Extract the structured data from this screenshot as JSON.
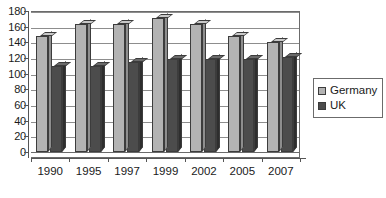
{
  "chart_data": {
    "type": "bar",
    "title": "",
    "subtitle": "",
    "xlabel": "",
    "ylabel": "",
    "categories": [
      "1990",
      "1995",
      "1997",
      "1999",
      "2002",
      "2005",
      "2007"
    ],
    "series": [
      {
        "name": "Germany",
        "color": "#b3b3b3",
        "values": [
          148,
          163,
          163,
          171,
          163,
          148,
          141
        ]
      },
      {
        "name": "UK",
        "color": "#4c4c4c",
        "values": [
          110,
          110,
          115,
          119,
          119,
          119,
          121
        ]
      }
    ],
    "ylim": [
      0,
      180
    ],
    "y_ticks": [
      0,
      20,
      40,
      60,
      80,
      100,
      120,
      140,
      160,
      180
    ],
    "y_tick_labels": [
      "0",
      "20",
      "40",
      "60",
      "80",
      "100",
      "120",
      "140",
      "160",
      "180"
    ],
    "grid": true,
    "grid_axis": "y",
    "legend": {
      "position": "right",
      "entries": [
        {
          "label": "Germany",
          "swatch_name": "germany-swatch"
        },
        {
          "label": "UK",
          "swatch_name": "uk-swatch"
        }
      ]
    },
    "style": {
      "three_d": true,
      "plot_background": "#ffffff",
      "axis_color": "#555555",
      "gridline_color": "#8d8d8d",
      "bar_outline": "#3c3c3c"
    }
  }
}
